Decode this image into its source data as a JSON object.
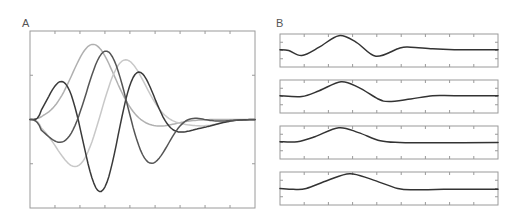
{
  "chart_data": [
    {
      "panel": "A",
      "type": "line",
      "title": "A",
      "xlabel": "",
      "ylabel": "",
      "xlim": [
        0,
        1
      ],
      "ylim": [
        -1,
        1
      ],
      "xticks": [
        0.111,
        0.222,
        0.333,
        0.444,
        0.556,
        0.667,
        0.778,
        0.889
      ],
      "yticks": [
        -0.5,
        0,
        0.5
      ],
      "grid": false,
      "legend": "none",
      "samples": 121,
      "series": [
        {
          "name": "curve-1",
          "color": "#b0b0b0",
          "shape": {
            "amp": 0.85,
            "center": 0.28,
            "width": 0.13,
            "freq": 0.0,
            "phase": 0,
            "tail": -0.08
          }
        },
        {
          "name": "curve-2",
          "color": "#c8c8c8",
          "shape": {
            "amp": 0.9,
            "center": 0.33,
            "width": 0.17,
            "freq": 1.55,
            "phase": 3.3,
            "tail": -0.06
          }
        },
        {
          "name": "curve-3",
          "color": "#3a3a3a",
          "shape": {
            "amp": 0.82,
            "center": 0.33,
            "width": 0.2,
            "freq": 2.6,
            "phase": -0.35,
            "tail": -0.08
          }
        },
        {
          "name": "curve-4",
          "color": "#555555",
          "shape": {
            "amp": 0.8,
            "center": 0.38,
            "width": 0.2,
            "freq": 2.1,
            "phase": 3.5,
            "tail": -0.06
          }
        }
      ]
    },
    {
      "panel": "B",
      "type": "line",
      "title": "B",
      "xlabel": "",
      "ylabel": "",
      "xlim": [
        0,
        1
      ],
      "ylim": [
        -1,
        1
      ],
      "xticks": [
        0.111,
        0.222,
        0.333,
        0.444,
        0.556,
        0.667,
        0.778,
        0.889
      ],
      "yticks": [
        -0.5,
        0,
        0.5
      ],
      "grid": false,
      "legend": "none",
      "samples": 121,
      "subplots": [
        {
          "name": "subplot-1",
          "color": "#333333",
          "points": [
            [
              0,
              0.05
            ],
            [
              0.04,
              0.0
            ],
            [
              0.1,
              -0.3
            ],
            [
              0.18,
              0.2
            ],
            [
              0.27,
              0.9
            ],
            [
              0.35,
              0.5
            ],
            [
              0.44,
              -0.35
            ],
            [
              0.55,
              0.15
            ],
            [
              0.6,
              0.2
            ],
            [
              0.7,
              0.1
            ],
            [
              0.8,
              0.05
            ],
            [
              1,
              0.05
            ]
          ]
        },
        {
          "name": "subplot-2",
          "color": "#333333",
          "points": [
            [
              0,
              0.05
            ],
            [
              0.1,
              0.0
            ],
            [
              0.18,
              0.35
            ],
            [
              0.28,
              0.9
            ],
            [
              0.36,
              0.55
            ],
            [
              0.45,
              -0.15
            ],
            [
              0.5,
              -0.3
            ],
            [
              0.6,
              -0.15
            ],
            [
              0.7,
              0.05
            ],
            [
              0.8,
              0.05
            ],
            [
              1,
              0.05
            ]
          ]
        },
        {
          "name": "subplot-3",
          "color": "#333333",
          "points": [
            [
              0,
              0.05
            ],
            [
              0.08,
              0.05
            ],
            [
              0.16,
              0.35
            ],
            [
              0.27,
              0.9
            ],
            [
              0.36,
              0.6
            ],
            [
              0.46,
              0.1
            ],
            [
              0.55,
              0.0
            ],
            [
              0.7,
              -0.02
            ],
            [
              1,
              0.0
            ]
          ]
        },
        {
          "name": "subplot-4",
          "color": "#333333",
          "points": [
            [
              0,
              0.0
            ],
            [
              0.06,
              -0.05
            ],
            [
              0.12,
              0.0
            ],
            [
              0.22,
              0.5
            ],
            [
              0.32,
              0.9
            ],
            [
              0.42,
              0.55
            ],
            [
              0.54,
              0.0
            ],
            [
              0.62,
              -0.08
            ],
            [
              0.75,
              -0.05
            ],
            [
              1,
              -0.05
            ]
          ]
        }
      ]
    }
  ]
}
